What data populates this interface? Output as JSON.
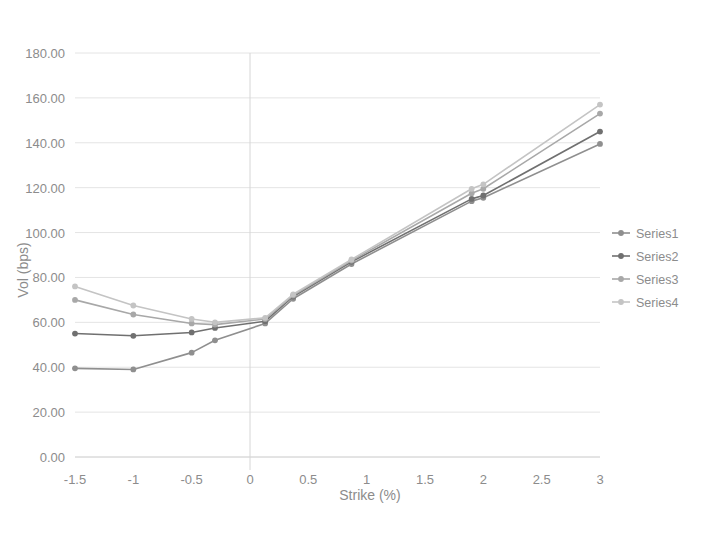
{
  "chart_data": {
    "type": "line",
    "title": "",
    "xlabel": "Strike (%)",
    "ylabel": "Vol (bps)",
    "xlim": [
      -1.5,
      3
    ],
    "ylim": [
      0,
      180
    ],
    "xticks": [
      "-1.5",
      "-1",
      "-0.5",
      "0",
      "0.5",
      "1",
      "1.5",
      "2",
      "2.5",
      "3"
    ],
    "xtick_values": [
      -1.5,
      -1,
      -0.5,
      0,
      0.5,
      1,
      1.5,
      2,
      2.5,
      3
    ],
    "yticks": [
      "0.00",
      "20.00",
      "40.00",
      "60.00",
      "80.00",
      "100.00",
      "120.00",
      "140.00",
      "160.00",
      "180.00"
    ],
    "ytick_values": [
      0,
      20,
      40,
      60,
      80,
      100,
      120,
      140,
      160,
      180
    ],
    "grid": true,
    "legend_position": "right",
    "x": [
      -1.5,
      -1.0,
      -0.5,
      -0.3,
      0.13,
      0.37,
      0.87,
      1.9,
      2.0,
      3.0
    ],
    "series": [
      {
        "name": "Series1",
        "color": "#8f8f8f",
        "values": [
          39.5,
          39.0,
          46.5,
          52.0,
          59.5,
          70.5,
          86.0,
          114.0,
          115.5,
          139.5
        ]
      },
      {
        "name": "Series2",
        "color": "#707070",
        "values": [
          55.0,
          54.0,
          55.5,
          57.5,
          60.5,
          71.5,
          87.0,
          115.0,
          116.5,
          145.0
        ]
      },
      {
        "name": "Series3",
        "color": "#a8a8a8",
        "values": [
          70.0,
          63.5,
          59.5,
          59.0,
          61.5,
          72.0,
          87.5,
          117.5,
          119.5,
          153.0
        ]
      },
      {
        "name": "Series4",
        "color": "#c4c4c4",
        "values": [
          76.0,
          67.5,
          61.5,
          60.0,
          62.0,
          72.5,
          88.0,
          119.5,
          121.5,
          157.0
        ]
      }
    ]
  },
  "legend": {
    "items": [
      {
        "label": "Series1"
      },
      {
        "label": "Series2"
      },
      {
        "label": "Series3"
      },
      {
        "label": "Series4"
      }
    ]
  }
}
